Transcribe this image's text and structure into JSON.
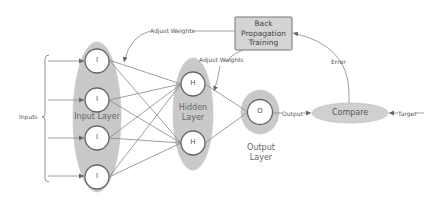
{
  "diagram": {
    "inputs_label": "Inputs",
    "input_layer": {
      "label": "Input Layer",
      "nodes": [
        "I",
        "I",
        "I",
        "I"
      ]
    },
    "hidden_layer": {
      "label_line1": "Hidden",
      "label_line2": "Layer",
      "nodes": [
        "H",
        "H"
      ]
    },
    "output_layer": {
      "label": "Output Layer",
      "node": "O"
    },
    "compare": {
      "label": "Compare"
    },
    "backprop": {
      "line1": "Back",
      "line2": "Propagation",
      "line3": "Training"
    },
    "edges": {
      "adjust_weights_1": "Adjust Weights",
      "adjust_weights_2": "Adjust Weights",
      "output": "Output",
      "target": "Target",
      "error": "Error"
    },
    "colors": {
      "layer_fill": "#c8c8c8",
      "node_fill": "#ffffff",
      "line": "#777777",
      "box_fill": "#d4d4d4"
    }
  }
}
